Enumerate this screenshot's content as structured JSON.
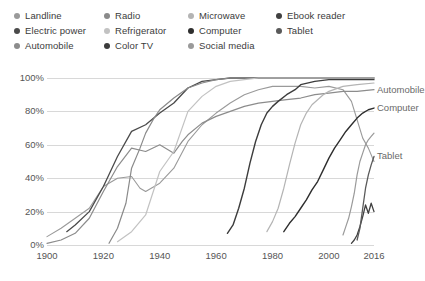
{
  "legend": {
    "columns": [
      {
        "x": 14,
        "items": [
          {
            "label": "Landline",
            "color": "#9a9a9a"
          },
          {
            "label": "Electric power",
            "color": "#4a4a4a"
          },
          {
            "label": "Automobile",
            "color": "#8c8c8c"
          }
        ]
      },
      {
        "x": 104,
        "items": [
          {
            "label": "Radio",
            "color": "#8a8a8a"
          },
          {
            "label": "Refrigerator",
            "color": "#c2c2c2"
          },
          {
            "label": "Color TV",
            "color": "#3c3c3c"
          }
        ]
      },
      {
        "x": 188,
        "items": [
          {
            "label": "Microwave",
            "color": "#b4b4b4"
          },
          {
            "label": "Computer",
            "color": "#2e2e2e"
          },
          {
            "label": "Social media",
            "color": "#9a9a9a"
          }
        ]
      },
      {
        "x": 276,
        "items": [
          {
            "label": "Ebook reader",
            "color": "#404040"
          },
          {
            "label": "Tablet",
            "color": "#5a5a5a"
          }
        ]
      }
    ]
  },
  "chart_data": {
    "type": "line",
    "title": "",
    "xlabel": "",
    "ylabel": "",
    "xlim": [
      1900,
      2016
    ],
    "ylim": [
      0,
      100
    ],
    "grid": true,
    "legend_position": "top",
    "ytick_labels": [
      "0%",
      "20%",
      "40%",
      "60%",
      "80%",
      "100%"
    ],
    "ytick_values": [
      0,
      20,
      40,
      60,
      80,
      100
    ],
    "xtick_labels": [
      "1900",
      "1920",
      "1940",
      "1960",
      "1980",
      "2000",
      "2016"
    ],
    "xtick_values": [
      1900,
      1920,
      1940,
      1960,
      1980,
      2000,
      2016
    ],
    "annotations": [
      {
        "text": "Automobile",
        "x": 2016,
        "y": 93
      },
      {
        "text": "Computer",
        "x": 2016,
        "y": 82
      },
      {
        "text": "Tablet",
        "x": 2016,
        "y": 53
      }
    ],
    "series": [
      {
        "name": "Landline",
        "color": "#9a9a9a",
        "width": 1.1,
        "points": [
          [
            1900,
            5
          ],
          [
            1905,
            10
          ],
          [
            1910,
            16
          ],
          [
            1915,
            22
          ],
          [
            1920,
            35
          ],
          [
            1925,
            40
          ],
          [
            1930,
            41
          ],
          [
            1933,
            34
          ],
          [
            1935,
            32
          ],
          [
            1940,
            37
          ],
          [
            1945,
            46
          ],
          [
            1950,
            62
          ],
          [
            1955,
            72
          ],
          [
            1960,
            79
          ],
          [
            1965,
            85
          ],
          [
            1970,
            90
          ],
          [
            1975,
            93
          ],
          [
            1980,
            95
          ],
          [
            1985,
            95
          ],
          [
            1990,
            95
          ],
          [
            1995,
            94
          ],
          [
            2000,
            95
          ],
          [
            2005,
            93
          ],
          [
            2008,
            86
          ],
          [
            2010,
            75
          ],
          [
            2012,
            64
          ],
          [
            2014,
            58
          ],
          [
            2016,
            50
          ]
        ]
      },
      {
        "name": "Electric power",
        "color": "#4a4a4a",
        "width": 1.3,
        "points": [
          [
            1907,
            8
          ],
          [
            1910,
            12
          ],
          [
            1915,
            20
          ],
          [
            1920,
            35
          ],
          [
            1925,
            53
          ],
          [
            1930,
            68
          ],
          [
            1935,
            72
          ],
          [
            1940,
            79
          ],
          [
            1945,
            85
          ],
          [
            1950,
            94
          ],
          [
            1955,
            98
          ],
          [
            1960,
            99
          ],
          [
            1965,
            100
          ],
          [
            1970,
            100
          ],
          [
            1980,
            100
          ],
          [
            1990,
            100
          ],
          [
            2000,
            100
          ],
          [
            2016,
            100
          ]
        ]
      },
      {
        "name": "Automobile",
        "color": "#8c8c8c",
        "width": 1.2,
        "points": [
          [
            1900,
            1
          ],
          [
            1905,
            3
          ],
          [
            1910,
            7
          ],
          [
            1915,
            16
          ],
          [
            1920,
            32
          ],
          [
            1925,
            47
          ],
          [
            1930,
            58
          ],
          [
            1935,
            56
          ],
          [
            1940,
            60
          ],
          [
            1945,
            55
          ],
          [
            1948,
            62
          ],
          [
            1950,
            66
          ],
          [
            1955,
            73
          ],
          [
            1960,
            77
          ],
          [
            1965,
            80
          ],
          [
            1970,
            83
          ],
          [
            1975,
            85
          ],
          [
            1980,
            86
          ],
          [
            1985,
            87
          ],
          [
            1990,
            88
          ],
          [
            1995,
            90
          ],
          [
            2000,
            91
          ],
          [
            2005,
            92
          ],
          [
            2010,
            92
          ],
          [
            2016,
            93
          ]
        ]
      },
      {
        "name": "Radio",
        "color": "#8a8a8a",
        "width": 1.2,
        "points": [
          [
            1922,
            1
          ],
          [
            1925,
            10
          ],
          [
            1928,
            25
          ],
          [
            1930,
            46
          ],
          [
            1933,
            58
          ],
          [
            1935,
            67
          ],
          [
            1938,
            76
          ],
          [
            1940,
            81
          ],
          [
            1945,
            88
          ],
          [
            1950,
            94
          ],
          [
            1955,
            97
          ],
          [
            1960,
            99
          ],
          [
            1965,
            100
          ],
          [
            1970,
            100
          ],
          [
            1980,
            100
          ],
          [
            1990,
            100
          ],
          [
            2000,
            100
          ],
          [
            2016,
            100
          ]
        ]
      },
      {
        "name": "Refrigerator",
        "color": "#c2c2c2",
        "width": 1.2,
        "points": [
          [
            1925,
            2
          ],
          [
            1930,
            8
          ],
          [
            1935,
            18
          ],
          [
            1940,
            44
          ],
          [
            1945,
            56
          ],
          [
            1950,
            80
          ],
          [
            1955,
            89
          ],
          [
            1960,
            95
          ],
          [
            1965,
            98
          ],
          [
            1970,
            99
          ],
          [
            1975,
            100
          ],
          [
            1980,
            100
          ],
          [
            1990,
            100
          ],
          [
            2000,
            100
          ],
          [
            2016,
            100
          ]
        ]
      },
      {
        "name": "Color TV",
        "color": "#3c3c3c",
        "width": 1.4,
        "points": [
          [
            1964,
            7
          ],
          [
            1966,
            12
          ],
          [
            1968,
            22
          ],
          [
            1970,
            34
          ],
          [
            1972,
            49
          ],
          [
            1974,
            62
          ],
          [
            1976,
            72
          ],
          [
            1978,
            79
          ],
          [
            1980,
            83
          ],
          [
            1982,
            86
          ],
          [
            1985,
            90
          ],
          [
            1988,
            93
          ],
          [
            1990,
            96
          ],
          [
            1995,
            98
          ],
          [
            2000,
            99
          ],
          [
            2005,
            99
          ],
          [
            2010,
            99
          ],
          [
            2016,
            99
          ]
        ]
      },
      {
        "name": "Microwave",
        "color": "#b4b4b4",
        "width": 1.2,
        "points": [
          [
            1978,
            8
          ],
          [
            1980,
            14
          ],
          [
            1982,
            22
          ],
          [
            1984,
            34
          ],
          [
            1986,
            48
          ],
          [
            1988,
            61
          ],
          [
            1990,
            72
          ],
          [
            1992,
            79
          ],
          [
            1994,
            84
          ],
          [
            1996,
            87
          ],
          [
            1998,
            90
          ],
          [
            2000,
            92
          ],
          [
            2005,
            95
          ],
          [
            2010,
            96
          ],
          [
            2016,
            97
          ]
        ]
      },
      {
        "name": "Computer",
        "color": "#2e2e2e",
        "width": 1.4,
        "points": [
          [
            1984,
            8
          ],
          [
            1986,
            13
          ],
          [
            1988,
            17
          ],
          [
            1990,
            22
          ],
          [
            1992,
            27
          ],
          [
            1994,
            33
          ],
          [
            1996,
            38
          ],
          [
            1998,
            45
          ],
          [
            2000,
            52
          ],
          [
            2002,
            58
          ],
          [
            2004,
            63
          ],
          [
            2006,
            68
          ],
          [
            2008,
            72
          ],
          [
            2010,
            76
          ],
          [
            2012,
            79
          ],
          [
            2014,
            81
          ],
          [
            2016,
            82
          ]
        ]
      },
      {
        "name": "Social media",
        "color": "#9a9a9a",
        "width": 1.2,
        "points": [
          [
            2005,
            6
          ],
          [
            2006,
            11
          ],
          [
            2007,
            16
          ],
          [
            2008,
            23
          ],
          [
            2009,
            31
          ],
          [
            2010,
            42
          ],
          [
            2011,
            50
          ],
          [
            2012,
            55
          ],
          [
            2013,
            60
          ],
          [
            2014,
            63
          ],
          [
            2015,
            65
          ],
          [
            2016,
            67
          ]
        ]
      },
      {
        "name": "Ebook reader",
        "color": "#404040",
        "width": 1.3,
        "points": [
          [
            2008,
            1
          ],
          [
            2009,
            3
          ],
          [
            2010,
            6
          ],
          [
            2011,
            11
          ],
          [
            2012,
            17
          ],
          [
            2013,
            24
          ],
          [
            2014,
            19
          ],
          [
            2015,
            25
          ],
          [
            2016,
            20
          ]
        ]
      },
      {
        "name": "Tablet",
        "color": "#5a5a5a",
        "width": 1.3,
        "points": [
          [
            2010,
            3
          ],
          [
            2011,
            10
          ],
          [
            2012,
            22
          ],
          [
            2013,
            34
          ],
          [
            2014,
            42
          ],
          [
            2015,
            48
          ],
          [
            2016,
            53
          ]
        ]
      }
    ]
  }
}
